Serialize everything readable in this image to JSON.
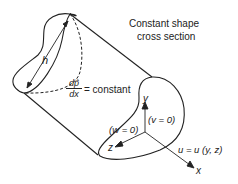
{
  "diagram": {
    "title_label": {
      "line1": "Constant shape",
      "line2": "cross section"
    },
    "height_label": "h",
    "pressure_gradient": {
      "numerator": "dp̂",
      "denominator": "dx",
      "rhs": "= constant"
    },
    "axes": {
      "y": "y",
      "z": "z",
      "x": "x"
    },
    "conditions": {
      "w": "(w = 0)",
      "v": "(v = 0)"
    },
    "velocity_label": "u = u (y, z)",
    "colors": {
      "stroke": "#222222",
      "background": "#ffffff"
    }
  }
}
